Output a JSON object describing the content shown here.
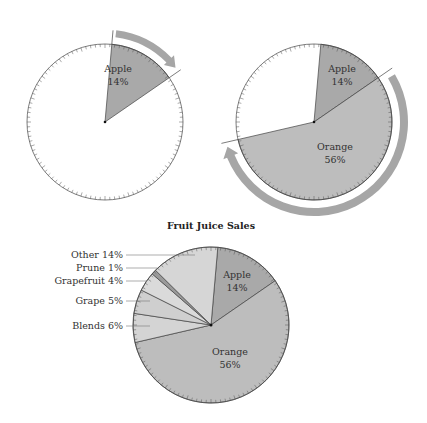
{
  "chart_data": [
    {
      "type": "pie",
      "panel": "step-1",
      "title": "",
      "categories": [
        "Apple"
      ],
      "values": [
        14
      ],
      "labels": [
        "Apple",
        "14%"
      ],
      "note": "Single Apple wedge shaded, remainder blank; curved arrow indicating clockwise direction"
    },
    {
      "type": "pie",
      "panel": "step-2",
      "title": "",
      "categories": [
        "Apple",
        "Orange"
      ],
      "values": [
        14,
        56
      ],
      "labels": [
        [
          "Apple",
          "14%"
        ],
        [
          "Orange",
          "56%"
        ]
      ],
      "note": "Orange wedge added clockwise after Apple; large curved arrow around Orange"
    },
    {
      "type": "pie",
      "panel": "final",
      "title": "Fruit Juice Sales",
      "categories": [
        "Apple",
        "Orange",
        "Blends",
        "Grape",
        "Grapefruit",
        "Prune",
        "Other"
      ],
      "values": [
        14,
        56,
        6,
        5,
        4,
        1,
        14
      ],
      "unit": "%",
      "inside_labels": [
        [
          "Apple",
          "14%"
        ],
        [
          "Orange",
          "56%"
        ]
      ],
      "callout_labels": [
        "Other 14%",
        "Prune 1%",
        "Grapefruit 4%",
        "Grape 5%",
        "Blends 6%"
      ]
    }
  ],
  "panels": {
    "left": {
      "slice_label": "Apple",
      "slice_value": "14%"
    },
    "right": {
      "apple_label": "Apple",
      "apple_value": "14%",
      "orange_label": "Orange",
      "orange_value": "56%"
    },
    "bottom": {
      "title": "Fruit Juice Sales",
      "apple_label": "Apple",
      "apple_value": "14%",
      "orange_label": "Orange",
      "orange_value": "56%",
      "callouts": [
        "Other 14%",
        "Prune 1%",
        "Grapefruit 4%",
        "Grape 5%",
        "Blends 6%"
      ]
    }
  },
  "colors": {
    "apple": "#a9a9a9",
    "orange": "#bdbdbd",
    "blends": "#d4d4d4",
    "grape": "#cfcfcf",
    "grapefruit": "#dadada",
    "prune": "#9a9a9a",
    "other": "#d6d6d6",
    "arrow": "#a6a6a6",
    "outline": "#444444"
  }
}
